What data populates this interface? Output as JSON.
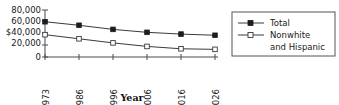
{
  "chart_data": {
    "type": "line",
    "title": "",
    "xlabel": "Year",
    "ylabel": "",
    "categories": [
      "1973",
      "1986",
      "1996",
      "2006",
      "2016",
      "2026"
    ],
    "x": [
      1973,
      1986,
      1996,
      2006,
      2016,
      2026
    ],
    "ylim": [
      0,
      80000
    ],
    "yticks": [
      0,
      20000,
      40000,
      60000,
      80000
    ],
    "ytick_labels": [
      "0",
      "20,000",
      "$40,000",
      "60,000",
      "80,000"
    ],
    "grid": false,
    "legend_position": "right",
    "series": [
      {
        "name": "Total",
        "marker": "filled-square",
        "values": [
          60000,
          54000,
          47000,
          42000,
          39000,
          37000
        ]
      },
      {
        "name": "Nonwhite and Hispanic",
        "marker": "open-square",
        "values": [
          38000,
          31000,
          24000,
          18000,
          14000,
          13000
        ]
      }
    ]
  },
  "axes": {
    "x_title": "Year",
    "y_tick_labels": [
      "80,000",
      "60,000",
      "$40,000",
      "20,000",
      "0"
    ],
    "x_tick_labels": [
      "1973",
      "1986",
      "1996",
      "2006",
      "2016",
      "2026"
    ]
  },
  "legend": {
    "entries": [
      {
        "label": "Total",
        "marker": "filled-square-marker"
      },
      {
        "label": "Nonwhite",
        "label2": "and Hispanic",
        "marker": "open-square-marker"
      }
    ]
  },
  "colors": {
    "line": "#3a3a3a",
    "axis": "#4a4a4a",
    "text": "#1a1a1a",
    "marker_fill": "#1c1c1c",
    "marker_open_fill": "#ffffff",
    "background": "#ffffff"
  }
}
